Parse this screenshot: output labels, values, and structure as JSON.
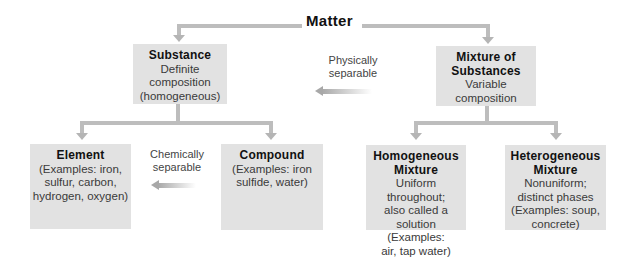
{
  "root": {
    "label": "Matter"
  },
  "level1": {
    "substance": {
      "title": "Substance",
      "lines": [
        "Definite",
        "composition",
        "(homogeneous)"
      ]
    },
    "mixture": {
      "title_lines": [
        "Mixture of",
        "Substances"
      ],
      "lines": [
        "Variable",
        "composition"
      ]
    }
  },
  "level2": {
    "element": {
      "title": "Element",
      "lines": [
        "(Examples: iron,",
        "sulfur, carbon,",
        "hydrogen, oxygen)"
      ]
    },
    "compound": {
      "title": "Compound",
      "lines": [
        "(Examples: iron",
        "sulfide, water)"
      ]
    },
    "homogeneous": {
      "title_lines": [
        "Homogeneous",
        "Mixture"
      ],
      "lines": [
        "Uniform throughout;",
        "also called a",
        "solution (Examples:",
        "air, tap water)"
      ]
    },
    "heterogeneous": {
      "title_lines": [
        "Heterogeneous",
        "Mixture"
      ],
      "lines": [
        "Nonuniform;",
        "distinct phases",
        "(Examples: soup,",
        "concrete)"
      ]
    }
  },
  "annotations": {
    "physically": [
      "Physically",
      "separable"
    ],
    "chemically": [
      "Chemically",
      "separable"
    ]
  },
  "colors": {
    "box_fill": "#e2e2e2",
    "connector": "#bdbdbd",
    "text": "#333333"
  }
}
